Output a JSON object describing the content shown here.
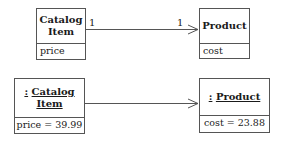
{
  "class_diagram": {
    "source": {
      "name_line1": "Catalog",
      "name_line2": "Item",
      "attribute": "price"
    },
    "target": {
      "name": "Product",
      "attribute": "cost"
    },
    "association": {
      "source_multiplicity": "1",
      "target_multiplicity": "1",
      "navigable": "target"
    }
  },
  "object_diagram": {
    "source": {
      "name_prefix": ":",
      "name_line1": "Catalog",
      "name_line2": "Item",
      "attribute": "price = 39.99"
    },
    "target": {
      "name_prefix": ":",
      "name": "Product",
      "attribute": "cost = 23.88"
    },
    "link": {
      "navigable": "target"
    }
  },
  "colors": {
    "line": "#555555",
    "text": "#1a1a1a",
    "background": "#ffffff"
  }
}
